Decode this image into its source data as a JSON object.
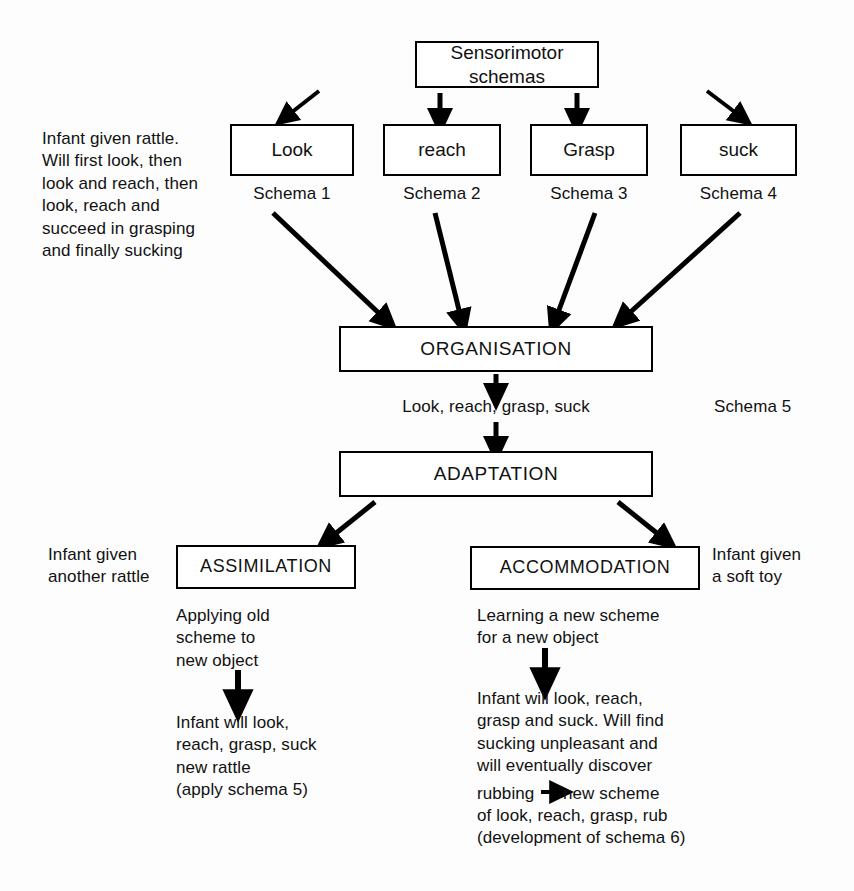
{
  "diagram": {
    "ink_color": "#000000",
    "background_color": "#ffffff"
  },
  "nodes": {
    "sensorimotor": "Sensorimotor\nschemas",
    "look": "Look",
    "reach": "reach",
    "grasp": "Grasp",
    "suck": "suck",
    "organisation": "ORGANISATION",
    "adaptation": "ADAPTATION",
    "assimilation": "ASSIMILATION",
    "accommodation": "ACCOMMODATION"
  },
  "captions": {
    "schema_1": "Schema 1",
    "schema_2": "Schema 2",
    "schema_3": "Schema 3",
    "schema_4": "Schema 4",
    "schema_5": "Schema 5",
    "organisation_output": "Look, reach, grasp, suck"
  },
  "notes": {
    "infant_rattle": "Infant given rattle.\nWill first look, then\nlook and reach, then\nlook, reach and\nsucceed in grasping\nand finally sucking",
    "infant_another_rattle": "Infant given\nanother rattle",
    "infant_soft_toy": "Infant given\na soft toy",
    "assimilation_description": "Applying old\nscheme to\nnew object",
    "assimilation_outcome": "Infant will look,\nreach, grasp, suck\nnew rattle\n(apply schema 5)",
    "accommodation_description": "Learning a new scheme\nfor a new object",
    "accommodation_outcome_a": "Infant will look, reach,\ngrasp and suck. Will find\nsucking unpleasant and\nwill eventually discover",
    "accommodation_outcome_b": "rubbing",
    "accommodation_outcome_c": "new scheme",
    "accommodation_outcome_d": "of look, reach, grasp, rub\n(development of schema 6)"
  },
  "icons": {
    "arrow_down": "arrow-down-icon",
    "arrow_diagonal": "arrow-diagonal-icon",
    "arrow_right": "arrow-right-icon"
  }
}
